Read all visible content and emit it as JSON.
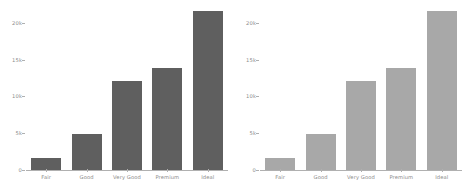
{
  "chart_data": [
    {
      "type": "bar",
      "panel": "left",
      "title": "",
      "xlabel": "",
      "ylabel": "",
      "categories": [
        "Fair",
        "Good",
        "Very Good",
        "Premium",
        "Ideal"
      ],
      "values": [
        1610,
        4906,
        12082,
        13791,
        21551
      ],
      "ytick_labels": [
        "0",
        "5k",
        "10k",
        "15k",
        "20k"
      ],
      "ytick_values": [
        0,
        5000,
        10000,
        15000,
        20000
      ],
      "ylim": [
        0,
        22000
      ],
      "grid": false,
      "legend": "none",
      "bar_color": "#5f5f5f",
      "axis_color": "#b0b0b0",
      "tick_text_color": "#8a8a8a"
    },
    {
      "type": "bar",
      "panel": "right",
      "title": "",
      "xlabel": "",
      "ylabel": "",
      "categories": [
        "Fair",
        "Good",
        "Very Good",
        "Premium",
        "Ideal"
      ],
      "values": [
        1610,
        4906,
        12082,
        13791,
        21551
      ],
      "ytick_labels": [
        "0",
        "5k",
        "10k",
        "15k",
        "20k"
      ],
      "ytick_values": [
        0,
        5000,
        10000,
        15000,
        20000
      ],
      "ylim": [
        0,
        22000
      ],
      "grid": false,
      "legend": "none",
      "bar_color": "#a8a8a8",
      "axis_color": "#b0b0b0",
      "tick_text_color": "#8a8a8a"
    }
  ]
}
